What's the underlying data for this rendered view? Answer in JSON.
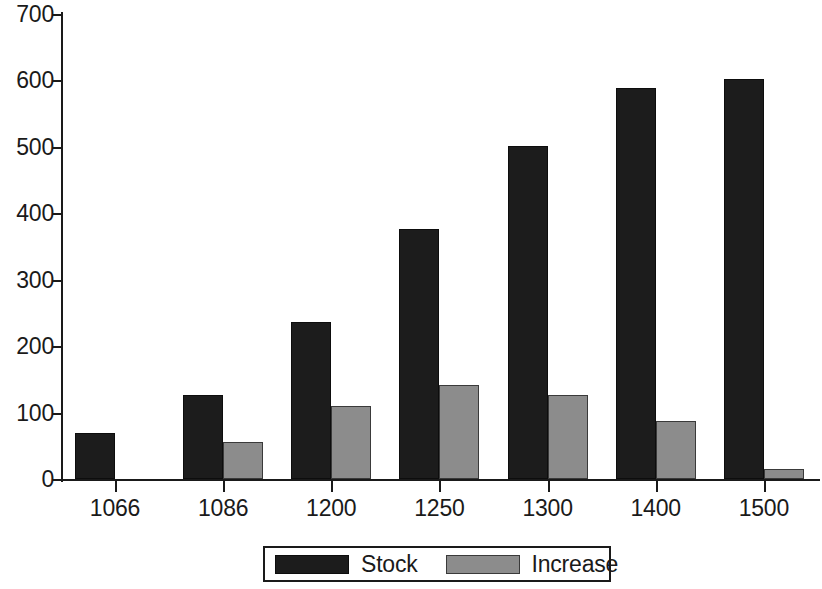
{
  "chart_data": {
    "type": "bar",
    "title": "",
    "subtitle": "",
    "xlabel": "",
    "ylabel": "",
    "categories": [
      "1066",
      "1086",
      "1200",
      "1250",
      "1300",
      "1400",
      "1500"
    ],
    "series": [
      {
        "name": "Stock",
        "color": "#1c1c1c",
        "values": [
          70,
          127,
          237,
          377,
          502,
          588,
          602
        ]
      },
      {
        "name": "Increase",
        "color": "#8c8c8c",
        "values": [
          null,
          56,
          110,
          142,
          127,
          88,
          15
        ]
      }
    ],
    "ylim": [
      0,
      700
    ],
    "y_ticks": [
      0,
      100,
      200,
      300,
      400,
      500,
      600,
      700
    ],
    "y_tick_labels": [
      "0",
      "100",
      "200",
      "300",
      "400",
      "500",
      "600",
      "700"
    ],
    "x_tick_labels": [
      "1066",
      "1086",
      "1200",
      "1250",
      "1300",
      "1400",
      "1500"
    ],
    "grid": false,
    "legend": {
      "position": "bottom-center",
      "entries": [
        {
          "label": "Stock",
          "color": "#1c1c1c"
        },
        {
          "label": "Increase",
          "color": "#8c8c8c"
        }
      ]
    },
    "annotations": []
  }
}
